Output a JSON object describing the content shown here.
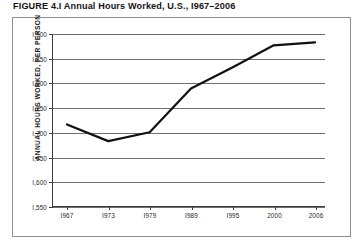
{
  "figure": {
    "title": "FIGURE 4.I Annual Hours Worked, U.S., I967–2006"
  },
  "chart_data": {
    "type": "line",
    "title": "FIGURE 4.I Annual Hours Worked, U.S., I967–2006",
    "xlabel": "",
    "ylabel": "ANNUAL HOURS WORKED, PER PERSON",
    "categories": [
      "I967",
      "I973",
      "I979",
      "I989",
      "I995",
      "2000",
      "2006"
    ],
    "x": [
      1967,
      1973,
      1979,
      1989,
      1995,
      2000,
      2006
    ],
    "values": [
      1716,
      1682,
      1700,
      1789,
      1832,
      1877,
      1883
    ],
    "ylim": [
      1550,
      1900
    ],
    "yticks": [
      1550,
      1600,
      1650,
      1700,
      1750,
      1800,
      1850,
      1900
    ],
    "ytick_labels": [
      "I,550",
      "I,600",
      "I,650",
      "I,700",
      "I,750",
      "I,800",
      "I,850",
      "I,900"
    ],
    "grid": true,
    "legend": false,
    "line_color": "#111111",
    "line_width": 2.2,
    "axis_color": "#3d3d3d",
    "grid_color": "#6f6f6f"
  }
}
